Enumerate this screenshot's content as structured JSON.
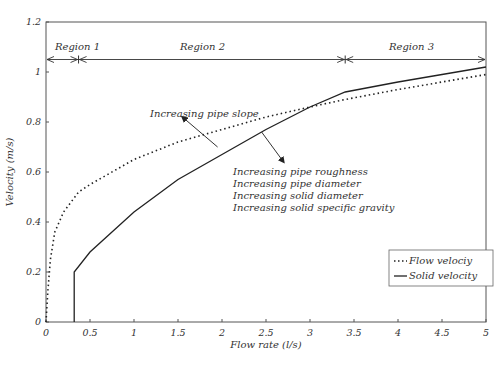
{
  "chart_data": {
    "type": "line",
    "title": "",
    "xlabel": "Flow rate (l/s)",
    "ylabel": "Velocity (m/s)",
    "xlim": [
      0,
      5
    ],
    "ylim": [
      0,
      1.2
    ],
    "grid": false,
    "x_ticks": [
      "0",
      "0.5",
      "1",
      "1.5",
      "2",
      "2.5",
      "3",
      "3.5",
      "4",
      "4.5",
      "5"
    ],
    "y_ticks": [
      "0",
      "0.2",
      "0.4",
      "0.6",
      "0.8",
      "1",
      "1.2"
    ],
    "legend_position": "lower right",
    "series": [
      {
        "name": "Flow velociy",
        "style": "dotted",
        "x": [
          0,
          0.02,
          0.05,
          0.1,
          0.2,
          0.37,
          0.5,
          1.0,
          1.5,
          2.0,
          2.5,
          3.0,
          3.4,
          4.0,
          4.5,
          5.0
        ],
        "y": [
          0,
          0.12,
          0.25,
          0.36,
          0.44,
          0.52,
          0.55,
          0.65,
          0.72,
          0.77,
          0.82,
          0.86,
          0.89,
          0.93,
          0.96,
          0.99
        ]
      },
      {
        "name": "Solid velocity",
        "style": "solid",
        "x": [
          0.32,
          0.32,
          0.5,
          1.0,
          1.5,
          2.0,
          2.5,
          3.0,
          3.4,
          4.0,
          4.5,
          5.0
        ],
        "y": [
          0,
          0.2,
          0.28,
          0.44,
          0.57,
          0.67,
          0.77,
          0.86,
          0.92,
          0.96,
          0.99,
          1.02
        ]
      }
    ],
    "regions": [
      {
        "label": "Region 1",
        "x_start": 0,
        "x_end": 0.37
      },
      {
        "label": "Region 2",
        "x_start": 0.37,
        "x_end": 3.4
      },
      {
        "label": "Region 3",
        "x_start": 3.4,
        "x_end": 5.0
      }
    ],
    "region_arrow_y": 1.05,
    "annotations": [
      {
        "text": "Increasing pipe slope",
        "arrow_from": [
          1.95,
          0.7
        ],
        "arrow_to": [
          1.55,
          0.82
        ]
      },
      {
        "text": "Increasing pipe roughness",
        "arrow_from": [
          2.45,
          0.76
        ],
        "arrow_to": [
          2.7,
          0.64
        ]
      },
      {
        "text": "Increasing pipe diameter"
      },
      {
        "text": "Increasing solid diameter"
      },
      {
        "text": "Increasing solid specific gravity"
      }
    ]
  },
  "labels": {
    "xlabel": "Flow rate (l/s)",
    "ylabel": "Velocity (m/s)",
    "region1": "Region 1",
    "region2": "Region 2",
    "region3": "Region 3",
    "annot_slope": "Increasing pipe slope",
    "annot_lines": [
      "Increasing pipe roughness",
      "Increasing pipe diameter",
      "Increasing solid diameter",
      "Increasing solid specific gravity"
    ],
    "legend_flow": "Flow velociy",
    "legend_solid": "Solid velocity"
  },
  "colors": {
    "axis": "#444444",
    "line": "#222222",
    "text": "#333333",
    "background": "#ffffff"
  }
}
